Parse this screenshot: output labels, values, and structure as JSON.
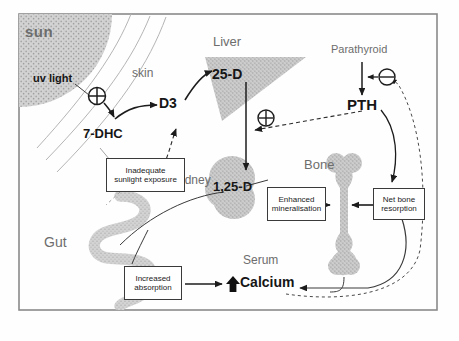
{
  "diagram": {
    "border_color": "#8a8a8a",
    "organ_fill": "#c9c9c9",
    "line_color": "#2b2b2b",
    "skin_line_color": "#b0b0b0",
    "label_grey": "#6d6d6d"
  },
  "organs": {
    "sun": "sun",
    "liver": "Liver",
    "kidney": "Kidney",
    "bone": "Bone",
    "gut": "Gut",
    "parathyroid": "Parathyroid",
    "serum": "Serum",
    "skin": "skin"
  },
  "metabolites": {
    "uv_light": "uv light",
    "dhc": "7-DHC",
    "d3": "D3",
    "d25": "25-D",
    "d125": "1,25-D",
    "pth": "PTH",
    "calcium": "Calcium",
    "calcium_arrow": "↑"
  },
  "boxes": {
    "inadequate": "Inadequate\nsunlight exposure",
    "inadequate_line1": "Inadequate",
    "inadequate_line2": "sunlight exposure",
    "mineralisation_line1": "Enhanced",
    "mineralisation_line2": "mineralisation",
    "resorption_line1": "Net bone",
    "resorption_line2": "resorption",
    "absorption_line1": "Increased",
    "absorption_line2": "absorption"
  },
  "signs": {
    "plus": "+",
    "minus": "−",
    "plus_uv": "plus-sign-uv",
    "plus_pth": "plus-sign-pth",
    "minus_calcium": "minus-sign-calcium"
  }
}
